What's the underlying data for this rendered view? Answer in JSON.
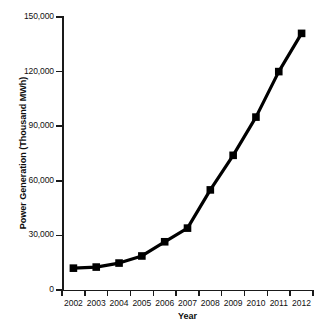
{
  "chart_data": {
    "type": "line",
    "title": "",
    "xlabel": "Year",
    "ylabel": "Power Generation (Thousand MWh)",
    "categories": [
      "2002",
      "2003",
      "2004",
      "2005",
      "2006",
      "2007",
      "2008",
      "2009",
      "2010",
      "2011",
      "2012"
    ],
    "x": [
      2002,
      2003,
      2004,
      2005,
      2006,
      2007,
      2008,
      2009,
      2010,
      2011,
      2012
    ],
    "values": [
      12000,
      12600,
      14800,
      18700,
      26500,
      34000,
      55000,
      74000,
      95000,
      120000,
      141000
    ],
    "series": [
      {
        "name": "Power Generation",
        "values": [
          12000,
          12600,
          14800,
          18700,
          26500,
          34000,
          55000,
          74000,
          95000,
          120000,
          141000
        ],
        "color": "#000000",
        "marker": "square"
      }
    ],
    "ylim": [
      0,
      150000
    ],
    "xlim": [
      2001.5,
      2012.5
    ],
    "yticks": [
      0,
      30000,
      60000,
      90000,
      120000,
      150000
    ],
    "ytick_labels": [
      "0",
      "30,000",
      "60,000",
      "90,000",
      "120,000",
      "150,000"
    ],
    "xtick_labels": [
      "2002",
      "2003",
      "2004",
      "2005",
      "2006",
      "2007",
      "2008",
      "2009",
      "2010",
      "2011",
      "2012"
    ],
    "grid": false,
    "legend": false,
    "legend_position": "none",
    "line_color": "#000000",
    "background_color": "#ffffff"
  }
}
